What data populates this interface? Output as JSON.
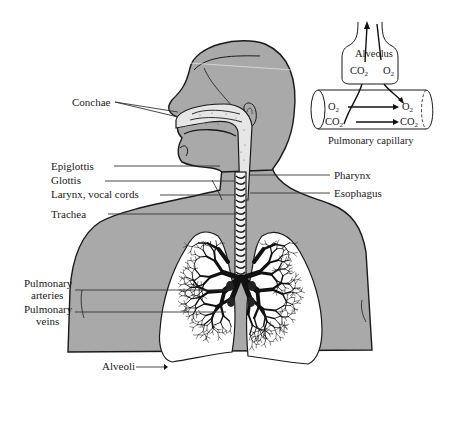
{
  "figure": {
    "labels": {
      "conchae": "Conchae",
      "epiglottis": "Epiglottis",
      "glottis": "Glottis",
      "larynx": "Larynx, vocal cords",
      "trachea": "Trachea",
      "pharynx": "Pharynx",
      "esophagus": "Esophagus",
      "pulmonary_arteries_1": "Pulmonary",
      "pulmonary_arteries_2": "arteries",
      "pulmonary_veins_1": "Pulmonary",
      "pulmonary_veins_2": "veins",
      "alveoli": "Alveoli"
    }
  },
  "inset": {
    "alveolus_label": "Alveolus",
    "alveolus_co2": "CO",
    "alveolus_o2": "O",
    "capillary_label": "Pulmonary capillary",
    "cap_o2_left": "O",
    "cap_co2_left": "CO",
    "cap_o2_right": "O",
    "cap_co2_right": "CO",
    "subscript": "2"
  },
  "colors": {
    "body_fill": "#a9a9a9",
    "outline": "#1a1a1a",
    "lung_fill": "#ffffff",
    "background": "#ffffff"
  }
}
